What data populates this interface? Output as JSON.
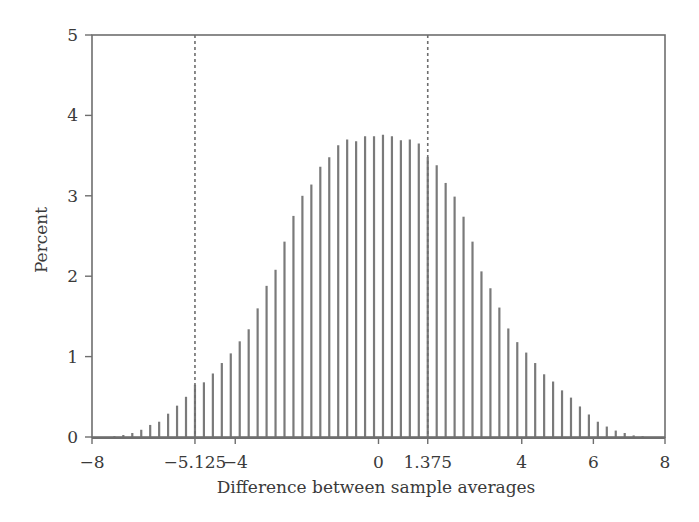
{
  "chart_data": {
    "type": "bar",
    "title": "",
    "xlabel": "Difference between sample averages",
    "ylabel": "Percent",
    "xlim": [
      -8,
      8
    ],
    "ylim": [
      0,
      5
    ],
    "grid": false,
    "legend": null,
    "bar_style": "needle",
    "bar_step": 0.25,
    "xticks": [
      {
        "value": -8,
        "label": "−8"
      },
      {
        "value": -5.125,
        "label": "−5.125"
      },
      {
        "value": -4,
        "label": "−4"
      },
      {
        "value": 0,
        "label": "0"
      },
      {
        "value": 1.375,
        "label": "1.375"
      },
      {
        "value": 4,
        "label": "4"
      },
      {
        "value": 6,
        "label": "6"
      },
      {
        "value": 8,
        "label": "8"
      }
    ],
    "yticks": [
      {
        "value": 0,
        "label": "0"
      },
      {
        "value": 1,
        "label": "1"
      },
      {
        "value": 2,
        "label": "2"
      },
      {
        "value": 3,
        "label": "3"
      },
      {
        "value": 4,
        "label": "4"
      },
      {
        "value": 5,
        "label": "5"
      }
    ],
    "reference_lines": [
      {
        "x": -5.125,
        "style": "dashed",
        "label": "observed difference (lower)"
      },
      {
        "x": 1.375,
        "style": "dashed",
        "label": "observed difference (upper)"
      }
    ],
    "x": [
      -7.875,
      -7.625,
      -7.375,
      -7.125,
      -6.875,
      -6.625,
      -6.375,
      -6.125,
      -5.875,
      -5.625,
      -5.375,
      -5.125,
      -4.875,
      -4.625,
      -4.375,
      -4.125,
      -3.875,
      -3.625,
      -3.375,
      -3.125,
      -2.875,
      -2.625,
      -2.375,
      -2.125,
      -1.875,
      -1.625,
      -1.375,
      -1.125,
      -0.875,
      -0.625,
      -0.375,
      -0.125,
      0.125,
      0.375,
      0.625,
      0.875,
      1.125,
      1.375,
      1.625,
      1.875,
      2.125,
      2.375,
      2.625,
      2.875,
      3.125,
      3.375,
      3.625,
      3.875,
      4.125,
      4.375,
      4.625,
      4.875,
      5.125,
      5.375,
      5.625,
      5.875,
      6.125,
      6.375,
      6.625,
      6.875,
      7.125,
      7.375,
      7.625,
      7.875
    ],
    "values": [
      0.0,
      0.0,
      0.01,
      0.025,
      0.05,
      0.09,
      0.15,
      0.19,
      0.29,
      0.39,
      0.5,
      0.65,
      0.68,
      0.79,
      0.92,
      1.04,
      1.19,
      1.34,
      1.6,
      1.88,
      2.08,
      2.43,
      2.75,
      3.0,
      3.14,
      3.36,
      3.48,
      3.63,
      3.7,
      3.68,
      3.74,
      3.74,
      3.76,
      3.74,
      3.69,
      3.7,
      3.65,
      3.48,
      3.38,
      3.16,
      2.99,
      2.74,
      2.43,
      2.06,
      1.85,
      1.61,
      1.35,
      1.18,
      1.05,
      0.92,
      0.78,
      0.69,
      0.58,
      0.49,
      0.38,
      0.28,
      0.19,
      0.13,
      0.08,
      0.05,
      0.02,
      0.01,
      0.0,
      0.0
    ]
  },
  "colors": {
    "bar": "#7a7a7a",
    "axis": "#6e6e6e",
    "reference_line": "#6e6e6e",
    "text": "#3a3a3a",
    "background": "#ffffff"
  },
  "layout": {
    "plot_left": 92,
    "plot_right": 665,
    "plot_top": 35,
    "plot_bottom": 437
  }
}
